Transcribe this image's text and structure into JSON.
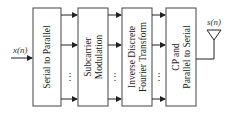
{
  "diagram": {
    "input": {
      "label": "x(n)"
    },
    "output": {
      "label": "s(n)",
      "icon": "antenna-icon"
    },
    "blocks": [
      {
        "id": "s2p",
        "lines": [
          "Serial to Parallel"
        ]
      },
      {
        "id": "mod",
        "lines": [
          "Subcarrier",
          "Modulation"
        ]
      },
      {
        "id": "idft",
        "lines": [
          "Inverse Discrete",
          "Fourier Transform"
        ]
      },
      {
        "id": "cp",
        "lines": [
          "CP and",
          "Parallel to Serial"
        ]
      }
    ],
    "ellipsis": "⋮"
  }
}
